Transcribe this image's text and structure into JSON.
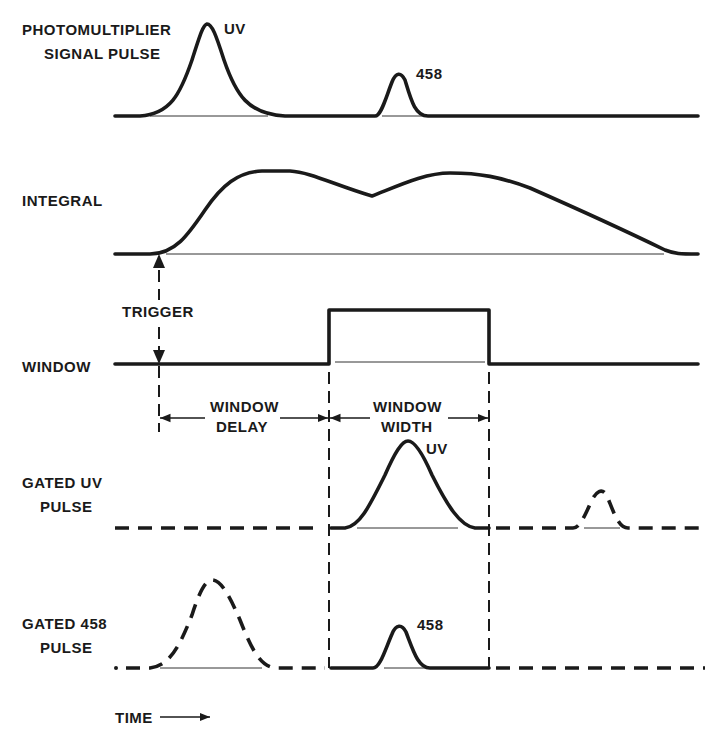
{
  "diagram": {
    "rows": [
      {
        "id": "pm",
        "label_lines": [
          "PHOTOMULTIPLIER",
          "SIGNAL PULSE"
        ]
      },
      {
        "id": "integral",
        "label_lines": [
          "INTEGRAL"
        ]
      },
      {
        "id": "window",
        "label_lines": [
          "WINDOW"
        ]
      },
      {
        "id": "gated_uv",
        "label_lines": [
          "GATED UV",
          "PULSE"
        ]
      },
      {
        "id": "gated_458",
        "label_lines": [
          "GATED 458",
          "PULSE"
        ]
      }
    ],
    "pulse_labels": {
      "pm_uv": "UV",
      "pm_458": "458",
      "gated_uv": "UV",
      "gated_458": "458"
    },
    "annotations": {
      "trigger": "TRIGGER",
      "window_delay": [
        "WINDOW",
        "DELAY"
      ],
      "window_width": [
        "WINDOW",
        "WIDTH"
      ],
      "time_axis": "TIME"
    },
    "colors": {
      "ink": "#1a1a1a",
      "background": "#ffffff"
    }
  }
}
